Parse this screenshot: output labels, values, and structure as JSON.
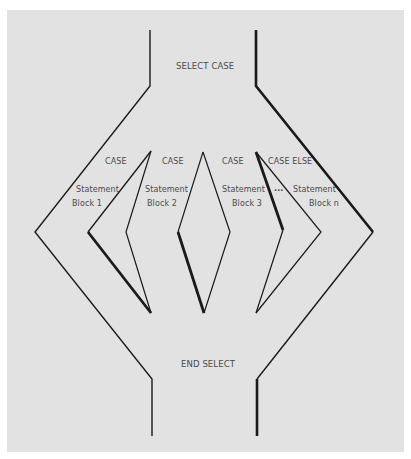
{
  "diagram": {
    "colors": {
      "background": "#e2e2e2",
      "line": "#1a1a1a",
      "text": "#4a4a4a"
    },
    "labels": {
      "select_case": "SELECT CASE",
      "end_select": "END SELECT",
      "ellipsis": "..."
    },
    "branches": [
      {
        "header": "CASE",
        "line1": "Statement",
        "line2": "Block 1"
      },
      {
        "header": "CASE",
        "line1": "Statement",
        "line2": "Block 2"
      },
      {
        "header": "CASE",
        "line1": "Statement",
        "line2": "Block 3"
      },
      {
        "header": "CASE ELSE",
        "line1": "Statement",
        "line2": "Block n"
      }
    ]
  }
}
